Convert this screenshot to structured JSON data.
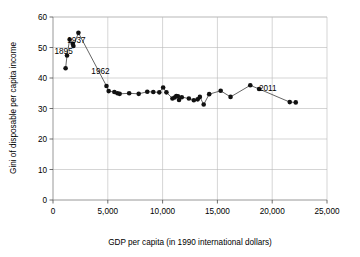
{
  "chart_data": {
    "type": "scatter",
    "title": "",
    "xlabel": "GDP per capita (in 1990 international dollars)",
    "ylabel": "Gini of disposable per capita income",
    "xlim": [
      0,
      25000
    ],
    "ylim": [
      0,
      60
    ],
    "xticks": [
      0,
      5000,
      10000,
      15000,
      20000,
      25000
    ],
    "xtick_labels": [
      "0",
      "5,000",
      "10,000",
      "15,000",
      "20,000",
      "25,000"
    ],
    "yticks": [
      0,
      10,
      20,
      30,
      40,
      50,
      60
    ],
    "ytick_labels": [
      "0",
      "10",
      "20",
      "30",
      "40",
      "50",
      "60"
    ],
    "grid": true,
    "legend": "none",
    "marker_style": "filled-circle",
    "connected": true,
    "series": [
      {
        "name": "Gini vs GDP per capita",
        "points": [
          [
            1150,
            43.2
          ],
          [
            1280,
            47.4
          ],
          [
            1520,
            52.6
          ],
          [
            1800,
            51.2
          ],
          [
            1860,
            50.5
          ],
          [
            2320,
            54.8
          ],
          [
            4880,
            37.4
          ],
          [
            5080,
            35.7
          ],
          [
            5600,
            35.4
          ],
          [
            5880,
            35.0
          ],
          [
            6080,
            34.8
          ],
          [
            6950,
            35.0
          ],
          [
            7820,
            34.8
          ],
          [
            8600,
            35.5
          ],
          [
            9150,
            35.4
          ],
          [
            9700,
            35.3
          ],
          [
            10050,
            36.9
          ],
          [
            10350,
            35.3
          ],
          [
            10900,
            33.3
          ],
          [
            11100,
            33.6
          ],
          [
            11250,
            34.1
          ],
          [
            11400,
            34.0
          ],
          [
            11500,
            32.8
          ],
          [
            11750,
            33.7
          ],
          [
            12400,
            33.3
          ],
          [
            12850,
            32.7
          ],
          [
            13200,
            33.0
          ],
          [
            13400,
            33.8
          ],
          [
            13750,
            31.3
          ],
          [
            14250,
            34.7
          ],
          [
            15300,
            35.8
          ],
          [
            16200,
            33.8
          ],
          [
            18000,
            37.6
          ],
          [
            18800,
            36.4
          ],
          [
            21600,
            32.1
          ],
          [
            22150,
            32.0
          ]
        ]
      }
    ],
    "annotations": [
      {
        "label": "1895",
        "x": 1150,
        "y": 43.2,
        "dx": -2,
        "dy": -14
      },
      {
        "label": "1937",
        "x": 2320,
        "y": 54.8,
        "dx": -2,
        "dy": 10
      },
      {
        "label": "1962",
        "x": 4880,
        "y": 37.4,
        "dx": -6,
        "dy": -12
      },
      {
        "label": "2011",
        "x": 21600,
        "y": 32.1,
        "dx": -22,
        "dy": -11
      }
    ]
  }
}
